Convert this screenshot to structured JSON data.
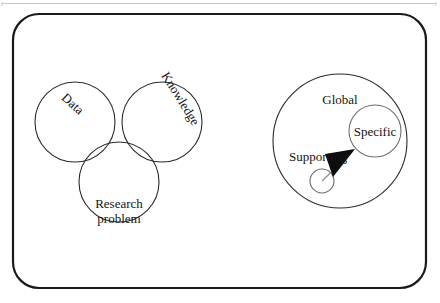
{
  "figure": {
    "background_color": "#ffffff",
    "stroke_color": "#1a1a1a",
    "shaded_fill": "#e9e9e9",
    "arrow_fill": "#0d0d0d",
    "top_rule": {
      "visible": true,
      "color": "#bdbdbd"
    },
    "frame": {
      "name": "rounded-rectangle-frame",
      "x": 13,
      "y": 14,
      "width": 413,
      "height": 274,
      "radius": 26,
      "stroke_width": 2.2
    }
  },
  "venn": {
    "name": "three-circle-venn",
    "circles": [
      {
        "id": "data",
        "label": "Data",
        "cx": 75,
        "cy": 122,
        "r": 40,
        "label_x": 70,
        "label_y": 107,
        "rotation": 42
      },
      {
        "id": "knowledge",
        "label": "Knowledge",
        "cx": 162,
        "cy": 122,
        "r": 40,
        "label_x": 177,
        "label_y": 101,
        "rotation": 58
      },
      {
        "id": "research",
        "label": "Research problem",
        "cx": 119,
        "cy": 182,
        "r": 40,
        "label_x": 119,
        "label_y": 208,
        "rotation": 0
      }
    ],
    "research_label_lines": [
      "Research",
      "problem"
    ],
    "intersection": {
      "name": "triple-intersection-shaded",
      "shaded": true,
      "fill": "#e9e9e9",
      "pattern": "stipple"
    }
  },
  "right_diagram": {
    "name": "global-specific-supporting",
    "global": {
      "label": "Global",
      "cx": 340,
      "cy": 141,
      "r": 67,
      "label_x": 340,
      "label_y": 104
    },
    "specific": {
      "label": "Specific",
      "cx": 375,
      "cy": 131,
      "r": 26,
      "label_x": 375,
      "label_y": 136
    },
    "supporting": {
      "label": "Supporting",
      "cx": 322,
      "cy": 181,
      "r": 12,
      "label_x": 318,
      "label_y": 161
    },
    "arrow": {
      "name": "supporting-to-specific-arrow",
      "from_x": 322,
      "from_y": 181,
      "to_x": 355,
      "to_y": 150,
      "head_points": "355,149 325,154 333,177",
      "fill": "#0d0d0d"
    }
  }
}
